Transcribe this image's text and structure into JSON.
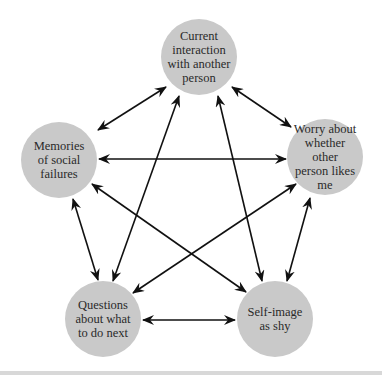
{
  "diagram": {
    "type": "cyclic-relationship-network",
    "colors": {
      "node_fill": "#c9c9c9",
      "node_text": "#2a2a2a",
      "arrow": "#111111",
      "background": "#ffffff"
    },
    "nodes": [
      {
        "id": "current",
        "label": "Current\ninteraction\nwith another\nperson"
      },
      {
        "id": "memories",
        "label": "Memories\nof social\nfailures"
      },
      {
        "id": "worry",
        "label": "Worry about\nwhether other\nperson likes\nme"
      },
      {
        "id": "questions",
        "label": "Questions\nabout what\nto do next"
      },
      {
        "id": "selfimage",
        "label": "Self-image\nas shy"
      }
    ],
    "edges": [
      {
        "from": "current",
        "to": "memories",
        "bidirectional": true
      },
      {
        "from": "current",
        "to": "worry",
        "bidirectional": true
      },
      {
        "from": "current",
        "to": "questions",
        "bidirectional": true
      },
      {
        "from": "current",
        "to": "selfimage",
        "bidirectional": true
      },
      {
        "from": "memories",
        "to": "worry",
        "bidirectional": true
      },
      {
        "from": "memories",
        "to": "questions",
        "bidirectional": true
      },
      {
        "from": "memories",
        "to": "selfimage",
        "bidirectional": true
      },
      {
        "from": "worry",
        "to": "questions",
        "bidirectional": true
      },
      {
        "from": "worry",
        "to": "selfimage",
        "bidirectional": true
      },
      {
        "from": "questions",
        "to": "selfimage",
        "bidirectional": true
      }
    ]
  }
}
